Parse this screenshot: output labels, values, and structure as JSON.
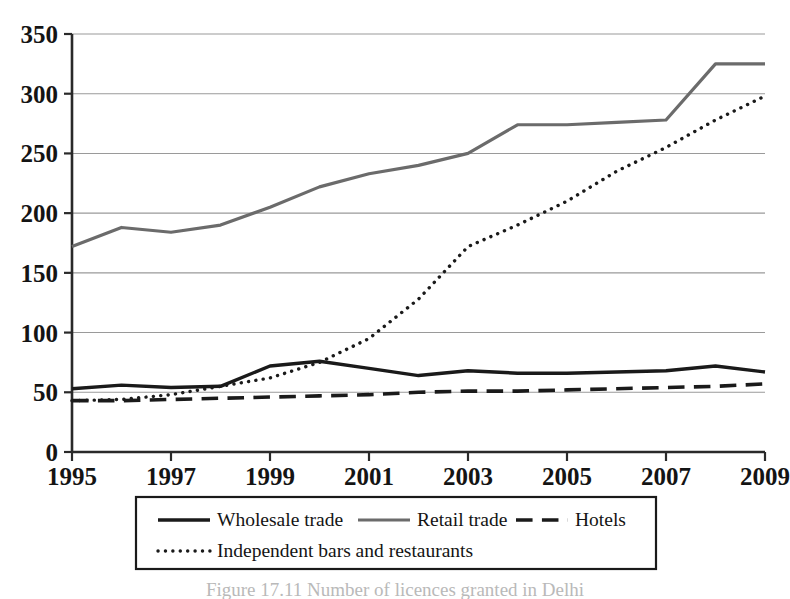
{
  "chart_data": {
    "type": "line",
    "title": "",
    "xlabel": "",
    "ylabel": "",
    "x": [
      1995,
      1996,
      1997,
      1998,
      1999,
      2000,
      2001,
      2002,
      2003,
      2004,
      2005,
      2006,
      2007,
      2008,
      2009
    ],
    "xlim": [
      1995,
      2009
    ],
    "ylim": [
      0,
      350
    ],
    "xticks": [
      1995,
      1997,
      1999,
      2001,
      2003,
      2005,
      2007,
      2009
    ],
    "xtick_labels": [
      "1995",
      "1997",
      "1999",
      "2001",
      "2003",
      "2005",
      "2007",
      "2009"
    ],
    "yticks": [
      0,
      50,
      100,
      150,
      200,
      250,
      300,
      350
    ],
    "ytick_labels": [
      "0",
      "50",
      "100",
      "150",
      "200",
      "250",
      "300",
      "350"
    ],
    "grid": "horizontal",
    "legend_position": "bottom",
    "series": [
      {
        "name": "Wholesale trade",
        "style": "solid",
        "color": "#1a1a1a",
        "width": 3.4,
        "values": [
          53,
          56,
          54,
          55,
          72,
          76,
          70,
          64,
          68,
          66,
          66,
          67,
          68,
          72,
          67
        ]
      },
      {
        "name": "Retail trade",
        "style": "solid",
        "color": "#6b6b6b",
        "width": 3.2,
        "values": [
          172,
          188,
          184,
          190,
          205,
          222,
          233,
          240,
          250,
          274,
          274,
          276,
          278,
          325,
          325
        ]
      },
      {
        "name": "Hotels",
        "style": "dashed",
        "color": "#1a1a1a",
        "width": 3.6,
        "values": [
          43,
          43,
          44,
          45,
          46,
          47,
          48,
          50,
          51,
          51,
          52,
          53,
          54,
          55,
          57
        ]
      },
      {
        "name": "Independent bars and restaurants",
        "style": "dotted",
        "color": "#1a1a1a",
        "width": 3.4,
        "values": [
          43,
          44,
          48,
          55,
          62,
          75,
          95,
          128,
          172,
          190,
          210,
          235,
          255,
          278,
          298
        ]
      }
    ]
  },
  "legend": {
    "entries": [
      {
        "label": "Wholesale trade",
        "swatch": "solid-dark"
      },
      {
        "label": "Retail trade",
        "swatch": "solid-gray"
      },
      {
        "label": "Hotels",
        "swatch": "dashed-dark"
      },
      {
        "label": "Independent bars and restaurants",
        "swatch": "dotted-dark"
      }
    ]
  },
  "caption": {
    "text": "Figure 17.11  Number of licences granted in Delhi"
  },
  "colors": {
    "ink": "#1a1a1a",
    "retail_gray": "#6b6b6b",
    "grid": "#9a9a9a",
    "axis": "#2a2a2a",
    "caption_faded": "#c4c4c4"
  }
}
